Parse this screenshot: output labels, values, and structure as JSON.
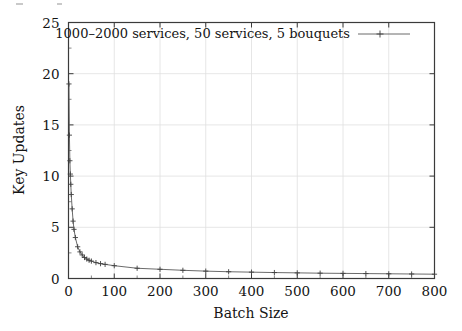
{
  "chart_data": {
    "type": "line",
    "title": "",
    "xlabel": "Batch Size",
    "ylabel": "Key Updates",
    "xlim": [
      0,
      800
    ],
    "ylim": [
      0,
      25
    ],
    "xticks": [
      0,
      100,
      200,
      300,
      400,
      500,
      600,
      700,
      800
    ],
    "yticks": [
      0,
      5,
      10,
      15,
      20,
      25
    ],
    "xtick_labels": [
      "0",
      "100",
      "200",
      "300",
      "400",
      "500",
      "600",
      "700",
      "800"
    ],
    "ytick_labels": [
      "0",
      "5",
      "10",
      "15",
      "20",
      "25"
    ],
    "grid": true,
    "legend_position": "top-center-inside",
    "marker": "plus",
    "line_color": "#5a5a5a",
    "series": [
      {
        "name": "1000–2000 services, 50 services, 5 bouquets",
        "x": [
          1,
          2,
          3,
          4,
          5,
          6,
          8,
          10,
          12,
          15,
          20,
          25,
          30,
          35,
          40,
          45,
          50,
          60,
          70,
          80,
          100,
          150,
          200,
          250,
          300,
          350,
          400,
          450,
          500,
          550,
          600,
          650,
          700,
          750,
          800
        ],
        "y": [
          19.0,
          14.0,
          11.5,
          10.2,
          9.2,
          8.2,
          6.8,
          5.6,
          4.8,
          4.0,
          3.1,
          2.6,
          2.3,
          2.05,
          1.9,
          1.78,
          1.7,
          1.55,
          1.45,
          1.38,
          1.25,
          1.0,
          0.9,
          0.8,
          0.72,
          0.66,
          0.62,
          0.58,
          0.55,
          0.52,
          0.5,
          0.48,
          0.46,
          0.44,
          0.42
        ]
      }
    ]
  },
  "legend": {
    "entries": [
      {
        "label": "1000–2000 services, 50 services, 5 bouquets",
        "marker": "plus-marker"
      }
    ]
  },
  "axes": {
    "x_title": "Batch Size",
    "y_title": "Key Updates"
  }
}
